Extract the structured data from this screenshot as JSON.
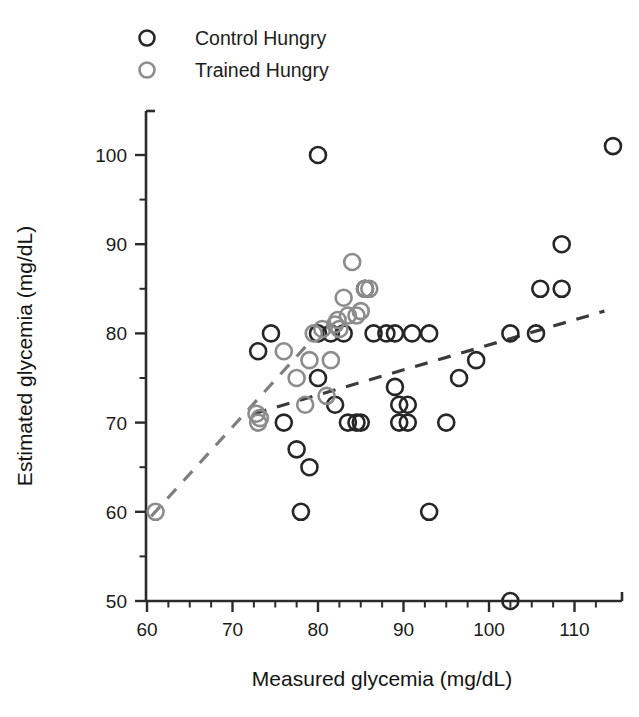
{
  "figure": {
    "background_color": "#ffffff",
    "frame_color": "#2b2b2b"
  },
  "legend": {
    "position": "top-left",
    "entries": [
      {
        "label": "Control Hungry",
        "marker": "open-circle",
        "color": "#262626",
        "name": "legend-item-control-hungry"
      },
      {
        "label": "Trained Hungry",
        "marker": "open-circle",
        "color": "#8c8c8c",
        "name": "legend-item-trained-hungry"
      }
    ]
  },
  "chart_data": {
    "type": "scatter",
    "title": "",
    "xlabel": "Measured glycemia (mg/dL)",
    "ylabel": "Estimated glycemia (mg/dL)",
    "xlim": [
      58,
      116
    ],
    "ylim": [
      50,
      104
    ],
    "xticks": [
      60,
      70,
      80,
      90,
      100,
      110
    ],
    "yticks": [
      50,
      60,
      70,
      80,
      90,
      100
    ],
    "xtick_labels": [
      "60",
      "70",
      "80",
      "90",
      "100",
      "110"
    ],
    "ytick_labels": [
      "50",
      "60",
      "70",
      "80",
      "90",
      "100"
    ],
    "x_minor_step": 2.5,
    "y_minor_step": 5,
    "grid": false,
    "legend_position": "top-left",
    "marker_style": "open-circle",
    "marker_radius_px": 8,
    "series": [
      {
        "name": "Control Hungry",
        "color": "#262626",
        "points": [
          [
            73.0,
            78.0
          ],
          [
            74.5,
            80.0
          ],
          [
            76.0,
            70.0
          ],
          [
            77.5,
            67.0
          ],
          [
            78.0,
            60.0
          ],
          [
            79.0,
            65.0
          ],
          [
            80.0,
            100.0
          ],
          [
            80.0,
            80.0
          ],
          [
            80.0,
            75.0
          ],
          [
            81.5,
            80.0
          ],
          [
            82.0,
            72.0
          ],
          [
            83.0,
            80.0
          ],
          [
            83.5,
            70.0
          ],
          [
            84.5,
            70.0
          ],
          [
            85.0,
            70.0
          ],
          [
            85.5,
            85.0
          ],
          [
            86.5,
            80.0
          ],
          [
            88.0,
            80.0
          ],
          [
            89.0,
            80.0
          ],
          [
            89.0,
            74.0
          ],
          [
            89.5,
            72.0
          ],
          [
            89.5,
            70.0
          ],
          [
            90.5,
            70.0
          ],
          [
            90.5,
            72.0
          ],
          [
            91.0,
            80.0
          ],
          [
            93.0,
            80.0
          ],
          [
            93.0,
            60.0
          ],
          [
            95.0,
            70.0
          ],
          [
            96.5,
            75.0
          ],
          [
            98.5,
            77.0
          ],
          [
            102.5,
            50.0
          ],
          [
            102.5,
            80.0
          ],
          [
            105.5,
            80.0
          ],
          [
            106.0,
            85.0
          ],
          [
            108.5,
            90.0
          ],
          [
            108.5,
            85.0
          ],
          [
            114.5,
            101.0
          ]
        ]
      },
      {
        "name": "Trained Hungry",
        "color": "#8c8c8c",
        "points": [
          [
            61.0,
            60.0
          ],
          [
            72.8,
            71.0
          ],
          [
            73.0,
            70.0
          ],
          [
            73.2,
            70.5
          ],
          [
            76.0,
            78.0
          ],
          [
            77.5,
            75.0
          ],
          [
            78.5,
            72.0
          ],
          [
            79.0,
            77.0
          ],
          [
            79.5,
            80.0
          ],
          [
            80.5,
            80.5
          ],
          [
            81.0,
            73.0
          ],
          [
            81.5,
            77.0
          ],
          [
            82.0,
            81.0
          ],
          [
            82.3,
            81.5
          ],
          [
            82.5,
            80.5
          ],
          [
            83.0,
            84.0
          ],
          [
            83.5,
            82.0
          ],
          [
            84.0,
            88.0
          ],
          [
            84.5,
            82.0
          ],
          [
            85.0,
            82.5
          ],
          [
            85.5,
            85.0
          ],
          [
            86.0,
            85.0
          ]
        ]
      }
    ],
    "trendlines": [
      {
        "name": "Control Hungry trendline",
        "color": "#3a3a3a",
        "style": "dashed",
        "x_start": 72.5,
        "y_start": 71.0,
        "x_end": 113.5,
        "y_end": 82.5
      },
      {
        "name": "Trained Hungry trendline",
        "color": "#7f7f7f",
        "style": "dashed",
        "x_start": 60.5,
        "y_start": 59.5,
        "x_end": 79.0,
        "y_end": 79.0
      }
    ]
  }
}
